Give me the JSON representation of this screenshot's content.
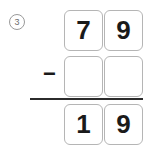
{
  "problem": {
    "number_label": "3",
    "operator": "−",
    "operator_icon": "minus-icon",
    "minuend": {
      "digits": [
        "7",
        "9"
      ],
      "value": "79"
    },
    "subtrahend": {
      "digits": [
        "",
        ""
      ],
      "value": ""
    },
    "answer": {
      "digits": [
        "1",
        "9"
      ],
      "value": "19"
    }
  },
  "colors": {
    "cell_border": "#b5b5b5",
    "digit": "#1a1a1a",
    "rule": "#2b2b2b",
    "number_marker": "#6e6e6e",
    "background": "#ffffff"
  }
}
